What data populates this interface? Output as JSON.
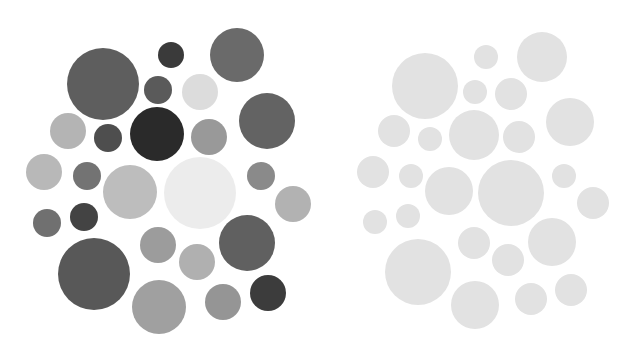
{
  "diagram": {
    "type": "circle-grayscale-comparison",
    "panels": [
      {
        "id": "left",
        "label": "varied-gray-circles",
        "circles": [
          {
            "cx": 103,
            "cy": 84,
            "r": 36,
            "fill": "#5e5e5e"
          },
          {
            "cx": 171,
            "cy": 55,
            "r": 13,
            "fill": "#3a3a3a"
          },
          {
            "cx": 237,
            "cy": 55,
            "r": 27,
            "fill": "#6a6a6a"
          },
          {
            "cx": 158,
            "cy": 90,
            "r": 14,
            "fill": "#5a5a5a"
          },
          {
            "cx": 200,
            "cy": 92,
            "r": 18,
            "fill": "#dcdcdc"
          },
          {
            "cx": 267,
            "cy": 121,
            "r": 28,
            "fill": "#636363"
          },
          {
            "cx": 68,
            "cy": 131,
            "r": 18,
            "fill": "#b4b4b4"
          },
          {
            "cx": 108,
            "cy": 138,
            "r": 14,
            "fill": "#4e4e4e"
          },
          {
            "cx": 157,
            "cy": 134,
            "r": 27,
            "fill": "#2a2a2a"
          },
          {
            "cx": 209,
            "cy": 137,
            "r": 18,
            "fill": "#999999"
          },
          {
            "cx": 44,
            "cy": 172,
            "r": 18,
            "fill": "#b8b8b8"
          },
          {
            "cx": 87,
            "cy": 176,
            "r": 14,
            "fill": "#737373"
          },
          {
            "cx": 130,
            "cy": 192,
            "r": 27,
            "fill": "#bdbdbd"
          },
          {
            "cx": 200,
            "cy": 193,
            "r": 36,
            "fill": "#ececec"
          },
          {
            "cx": 261,
            "cy": 176,
            "r": 14,
            "fill": "#8a8a8a"
          },
          {
            "cx": 293,
            "cy": 204,
            "r": 18,
            "fill": "#b2b2b2"
          },
          {
            "cx": 47,
            "cy": 223,
            "r": 14,
            "fill": "#707070"
          },
          {
            "cx": 84,
            "cy": 217,
            "r": 14,
            "fill": "#434343"
          },
          {
            "cx": 158,
            "cy": 245,
            "r": 18,
            "fill": "#9c9c9c"
          },
          {
            "cx": 247,
            "cy": 243,
            "r": 28,
            "fill": "#606060"
          },
          {
            "cx": 197,
            "cy": 262,
            "r": 18,
            "fill": "#b0b0b0"
          },
          {
            "cx": 94,
            "cy": 274,
            "r": 36,
            "fill": "#585858"
          },
          {
            "cx": 159,
            "cy": 307,
            "r": 27,
            "fill": "#a0a0a0"
          },
          {
            "cx": 223,
            "cy": 302,
            "r": 18,
            "fill": "#959595"
          },
          {
            "cx": 268,
            "cy": 293,
            "r": 18,
            "fill": "#3c3c3c"
          }
        ]
      },
      {
        "id": "right",
        "label": "uniform-light-circles",
        "fill": "#e2e2e2",
        "circles": [
          {
            "cx": 486,
            "cy": 57,
            "r": 12
          },
          {
            "cx": 542,
            "cy": 57,
            "r": 25
          },
          {
            "cx": 425,
            "cy": 86,
            "r": 33
          },
          {
            "cx": 475,
            "cy": 92,
            "r": 12
          },
          {
            "cx": 511,
            "cy": 94,
            "r": 16
          },
          {
            "cx": 570,
            "cy": 122,
            "r": 24
          },
          {
            "cx": 394,
            "cy": 131,
            "r": 16
          },
          {
            "cx": 430,
            "cy": 139,
            "r": 12
          },
          {
            "cx": 474,
            "cy": 135,
            "r": 25
          },
          {
            "cx": 519,
            "cy": 137,
            "r": 16
          },
          {
            "cx": 373,
            "cy": 172,
            "r": 16
          },
          {
            "cx": 411,
            "cy": 176,
            "r": 12
          },
          {
            "cx": 449,
            "cy": 191,
            "r": 24
          },
          {
            "cx": 511,
            "cy": 193,
            "r": 33
          },
          {
            "cx": 564,
            "cy": 176,
            "r": 12
          },
          {
            "cx": 593,
            "cy": 203,
            "r": 16
          },
          {
            "cx": 375,
            "cy": 222,
            "r": 12
          },
          {
            "cx": 408,
            "cy": 216,
            "r": 12
          },
          {
            "cx": 474,
            "cy": 243,
            "r": 16
          },
          {
            "cx": 552,
            "cy": 242,
            "r": 24
          },
          {
            "cx": 508,
            "cy": 260,
            "r": 16
          },
          {
            "cx": 418,
            "cy": 272,
            "r": 33
          },
          {
            "cx": 475,
            "cy": 305,
            "r": 24
          },
          {
            "cx": 531,
            "cy": 299,
            "r": 16
          },
          {
            "cx": 571,
            "cy": 290,
            "r": 16
          }
        ]
      }
    ]
  }
}
